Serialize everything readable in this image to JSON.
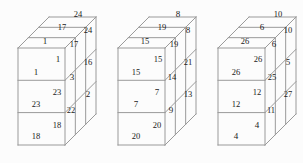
{
  "image": {
    "title": "Three isometric stacked-cube diagrams with numbered faces",
    "background_color": "#fcfcfc",
    "line_color": "#9a9a9a",
    "text_color": "#1a1a1a"
  },
  "figures": [
    {
      "name": "figure-1",
      "front_faces": [
        "1",
        "23",
        "18"
      ],
      "top_faces": [
        "1",
        "17",
        "24"
      ],
      "side_faces_near": [
        "1",
        "23",
        "18"
      ],
      "side_faces_mid": [
        "3",
        "22"
      ],
      "side_faces_far": [
        "17",
        "24",
        "16",
        "2"
      ],
      "labels": [
        {
          "text": "24",
          "x": 78,
          "y": 14
        },
        {
          "text": "17",
          "x": 62,
          "y": 27
        },
        {
          "text": "24",
          "x": 88,
          "y": 30
        },
        {
          "text": "1",
          "x": 45,
          "y": 41
        },
        {
          "text": "17",
          "x": 74,
          "y": 44
        },
        {
          "text": "1",
          "x": 58,
          "y": 59
        },
        {
          "text": "16",
          "x": 88,
          "y": 62
        },
        {
          "text": "1",
          "x": 36,
          "y": 72
        },
        {
          "text": "3",
          "x": 72,
          "y": 77
        },
        {
          "text": "23",
          "x": 57,
          "y": 92
        },
        {
          "text": "2",
          "x": 88,
          "y": 94
        },
        {
          "text": "23",
          "x": 36,
          "y": 104
        },
        {
          "text": "22",
          "x": 71,
          "y": 110
        },
        {
          "text": "18",
          "x": 57,
          "y": 125
        },
        {
          "text": "18",
          "x": 36,
          "y": 136
        }
      ]
    },
    {
      "name": "figure-2",
      "front_faces": [
        "15",
        "7",
        "20"
      ],
      "top_faces": [
        "15",
        "19",
        "8"
      ],
      "side_faces_near": [
        "15",
        "7",
        "20"
      ],
      "side_faces_mid": [
        "14",
        "9"
      ],
      "side_faces_far": [
        "19",
        "8",
        "21",
        "13"
      ],
      "labels": [
        {
          "text": "8",
          "x": 78,
          "y": 14
        },
        {
          "text": "19",
          "x": 62,
          "y": 27
        },
        {
          "text": "8",
          "x": 88,
          "y": 30
        },
        {
          "text": "15",
          "x": 45,
          "y": 41
        },
        {
          "text": "19",
          "x": 74,
          "y": 44
        },
        {
          "text": "15",
          "x": 58,
          "y": 59
        },
        {
          "text": "21",
          "x": 88,
          "y": 62
        },
        {
          "text": "15",
          "x": 36,
          "y": 72
        },
        {
          "text": "14",
          "x": 72,
          "y": 77
        },
        {
          "text": "7",
          "x": 57,
          "y": 92
        },
        {
          "text": "13",
          "x": 88,
          "y": 94
        },
        {
          "text": "7",
          "x": 36,
          "y": 104
        },
        {
          "text": "9",
          "x": 71,
          "y": 110
        },
        {
          "text": "20",
          "x": 57,
          "y": 125
        },
        {
          "text": "20",
          "x": 36,
          "y": 136
        }
      ]
    },
    {
      "name": "figure-3",
      "front_faces": [
        "26",
        "12",
        "4"
      ],
      "top_faces": [
        "26",
        "6",
        "10"
      ],
      "side_faces_near": [
        "26",
        "12",
        "4"
      ],
      "side_faces_mid": [
        "25",
        "11"
      ],
      "side_faces_far": [
        "6",
        "10",
        "5",
        "27"
      ],
      "labels": [
        {
          "text": "10",
          "x": 78,
          "y": 14
        },
        {
          "text": "6",
          "x": 62,
          "y": 27
        },
        {
          "text": "10",
          "x": 88,
          "y": 30
        },
        {
          "text": "26",
          "x": 45,
          "y": 41
        },
        {
          "text": "6",
          "x": 74,
          "y": 44
        },
        {
          "text": "26",
          "x": 58,
          "y": 59
        },
        {
          "text": "5",
          "x": 88,
          "y": 62
        },
        {
          "text": "26",
          "x": 36,
          "y": 72
        },
        {
          "text": "25",
          "x": 72,
          "y": 77
        },
        {
          "text": "12",
          "x": 57,
          "y": 92
        },
        {
          "text": "27",
          "x": 88,
          "y": 94
        },
        {
          "text": "12",
          "x": 36,
          "y": 104
        },
        {
          "text": "11",
          "x": 71,
          "y": 110
        },
        {
          "text": "4",
          "x": 57,
          "y": 125
        },
        {
          "text": "4",
          "x": 36,
          "y": 136
        }
      ]
    }
  ],
  "geometry": {
    "front_left": 18,
    "front_right": 65,
    "front_top": 48,
    "front_bottom": 145,
    "depth_dx": 31,
    "depth_dy": -31,
    "cell_h": 32.3,
    "figure_offsets": [
      0,
      100,
      200
    ]
  }
}
